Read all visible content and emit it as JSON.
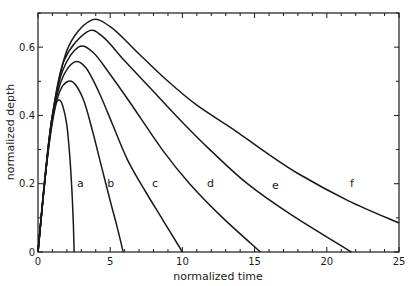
{
  "chart_data": {
    "type": "line",
    "title": "",
    "xlabel": "normalized time",
    "ylabel": "normalized depth",
    "xlim": [
      0,
      25
    ],
    "ylim": [
      0,
      0.7
    ],
    "xticks": [
      0,
      5,
      10,
      15,
      20,
      25
    ],
    "xtick_labels": [
      "0",
      "5",
      "10",
      "15",
      "20",
      "25"
    ],
    "yticks": [
      0,
      0.2,
      0.4,
      0.6
    ],
    "ytick_labels": [
      "0",
      "0.2",
      "0.4",
      "0.6"
    ],
    "grid": false,
    "legend": "none (curves labeled inline a–f)",
    "series": [
      {
        "name": "a",
        "label_pos": [
          2.7,
          0.19
        ],
        "x": [
          0,
          0.3,
          0.6,
          0.9,
          1.2,
          1.45,
          1.7,
          2.0,
          2.2,
          2.35,
          2.45,
          2.5
        ],
        "y": [
          0,
          0.14,
          0.27,
          0.37,
          0.43,
          0.445,
          0.43,
          0.37,
          0.28,
          0.18,
          0.08,
          0
        ]
      },
      {
        "name": "b",
        "label_pos": [
          4.8,
          0.19
        ],
        "x": [
          0,
          0.5,
          1.0,
          1.5,
          2.1,
          2.6,
          3.2,
          3.8,
          4.4,
          5.0,
          5.5,
          5.9
        ],
        "y": [
          0,
          0.22,
          0.38,
          0.47,
          0.5,
          0.49,
          0.44,
          0.35,
          0.25,
          0.15,
          0.07,
          0
        ]
      },
      {
        "name": "c",
        "label_pos": [
          7.9,
          0.19
        ],
        "x": [
          0,
          0.5,
          1.0,
          1.6,
          2.5,
          3.3,
          4.2,
          5.2,
          6.2,
          7.4,
          8.7,
          10
        ],
        "y": [
          0,
          0.22,
          0.39,
          0.5,
          0.556,
          0.54,
          0.47,
          0.37,
          0.27,
          0.18,
          0.09,
          0
        ]
      },
      {
        "name": "d",
        "label_pos": [
          11.7,
          0.19
        ],
        "x": [
          0,
          0.5,
          1.0,
          1.7,
          2.8,
          3.8,
          5,
          6.5,
          8.6,
          10.5,
          12.8,
          15.4
        ],
        "y": [
          0,
          0.22,
          0.4,
          0.53,
          0.6,
          0.585,
          0.52,
          0.43,
          0.3,
          0.2,
          0.1,
          0
        ]
      },
      {
        "name": "e",
        "label_pos": [
          16.2,
          0.185
        ],
        "x": [
          0,
          0.5,
          1.0,
          1.8,
          3.4,
          4.5,
          6,
          8,
          10,
          11.9,
          14.5,
          17.5,
          21.7
        ],
        "y": [
          0,
          0.22,
          0.4,
          0.56,
          0.645,
          0.63,
          0.56,
          0.47,
          0.38,
          0.3,
          0.2,
          0.11,
          0
        ]
      },
      {
        "name": "f",
        "label_pos": [
          21.6,
          0.19
        ],
        "x": [
          0,
          0.5,
          1.0,
          2.0,
          3.6,
          5,
          7,
          9,
          11,
          13.5,
          15.5,
          18,
          21.5,
          25
        ],
        "y": [
          0,
          0.22,
          0.4,
          0.59,
          0.677,
          0.66,
          0.58,
          0.5,
          0.43,
          0.36,
          0.3,
          0.23,
          0.15,
          0.085
        ]
      }
    ]
  },
  "colors": {
    "line": "#1a1a1a",
    "background": "#ffffff"
  }
}
